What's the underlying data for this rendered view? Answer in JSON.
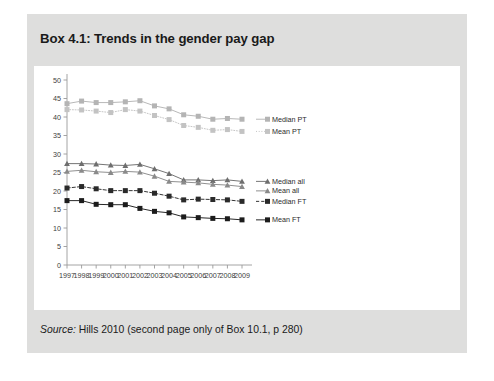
{
  "box": {
    "title": "Box 4.1: Trends in the gender pay gap",
    "source_label": "Source:",
    "source_text": "Hills 2010 (second page only of Box 10.1, p 280)",
    "source_full": "Source: Hills 2010 (second page only of Box 10.1, p 280)",
    "background_color": "#dededd",
    "panel_color": "#ffffff"
  },
  "chart_data": {
    "type": "line",
    "title": "",
    "xlabel": "",
    "ylabel": "",
    "categories": [
      "1997",
      "1998",
      "1999",
      "2000",
      "2001",
      "2002",
      "2003",
      "2004",
      "2005",
      "2006",
      "2007",
      "2008",
      "2009"
    ],
    "xlim": [
      1997,
      2009
    ],
    "ylim": [
      0,
      50
    ],
    "yticks": [
      0,
      5,
      10,
      15,
      20,
      25,
      30,
      35,
      40,
      45,
      50
    ],
    "grid": false,
    "legend_position": "right",
    "series": [
      {
        "name": "Median PT",
        "color": "#b4b4b4",
        "marker": "square",
        "dash": "solid",
        "values": [
          43.6,
          44.3,
          43.9,
          43.9,
          44.1,
          44.4,
          43.0,
          42.2,
          40.6,
          40.2,
          39.4,
          39.6,
          39.4
        ]
      },
      {
        "name": "Mean PT",
        "color": "#c3c3c3",
        "marker": "square",
        "dash": "dotted",
        "values": [
          42.0,
          41.9,
          41.6,
          41.2,
          42.0,
          41.6,
          40.4,
          39.3,
          37.7,
          37.2,
          36.4,
          36.6,
          36.1
        ]
      },
      {
        "name": "Median all",
        "color": "#6e6e6e",
        "marker": "triangle",
        "dash": "solid",
        "values": [
          27.4,
          27.4,
          27.3,
          27.0,
          26.9,
          27.2,
          26.0,
          24.7,
          23.0,
          23.0,
          22.8,
          23.0,
          22.6
        ]
      },
      {
        "name": "Mean all",
        "color": "#8a8a8a",
        "marker": "triangle",
        "dash": "solid",
        "values": [
          25.3,
          25.6,
          25.2,
          25.0,
          25.3,
          25.1,
          24.0,
          22.6,
          22.4,
          22.2,
          21.8,
          21.6,
          21.2
        ]
      },
      {
        "name": "Median FT",
        "color": "#2a2a2a",
        "marker": "square",
        "dash": "dashed",
        "values": [
          20.8,
          21.2,
          20.6,
          20.1,
          20.1,
          20.1,
          19.4,
          18.6,
          17.6,
          17.8,
          17.7,
          17.6,
          17.2
        ]
      },
      {
        "name": "Mean FT",
        "color": "#1c1c1c",
        "marker": "square",
        "dash": "solid",
        "values": [
          17.4,
          17.4,
          16.4,
          16.3,
          16.3,
          15.3,
          14.5,
          14.1,
          13.0,
          12.8,
          12.6,
          12.5,
          12.2
        ]
      }
    ]
  }
}
